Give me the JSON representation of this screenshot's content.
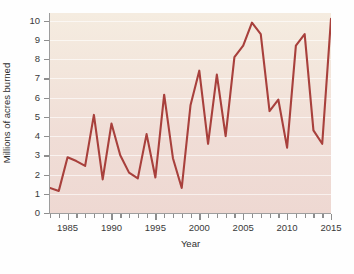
{
  "chart_data": {
    "type": "line",
    "title": "",
    "xlabel": "Year",
    "ylabel": "Millions of acres burned",
    "xlim": [
      1983,
      2015
    ],
    "ylim": [
      0,
      10.4
    ],
    "grid": true,
    "legend": "none",
    "line_color": "#a8403c",
    "x": [
      1983,
      1984,
      1985,
      1986,
      1987,
      1988,
      1989,
      1990,
      1991,
      1992,
      1993,
      1994,
      1995,
      1996,
      1997,
      1998,
      1999,
      2000,
      2001,
      2002,
      2003,
      2004,
      2005,
      2006,
      2007,
      2008,
      2009,
      2010,
      2011,
      2012,
      2013,
      2014,
      2015
    ],
    "values": [
      1.3,
      1.15,
      2.9,
      2.7,
      2.45,
      5.1,
      1.75,
      4.65,
      3.0,
      2.1,
      1.8,
      4.1,
      1.85,
      6.15,
      2.85,
      1.3,
      5.6,
      7.4,
      3.6,
      7.2,
      4.0,
      8.1,
      8.7,
      9.9,
      9.3,
      5.3,
      5.9,
      3.4,
      8.7,
      9.3,
      4.3,
      3.6,
      10.1
    ],
    "yticks": [
      0,
      1,
      2,
      3,
      4,
      5,
      6,
      7,
      8,
      9,
      10
    ],
    "xticks": [
      1985,
      1990,
      1995,
      2000,
      2005,
      2010,
      2015
    ],
    "xtick_minor_step": 1,
    "background_top_color": "#f5ece0",
    "background_bottom_color": "#eed8d2"
  }
}
